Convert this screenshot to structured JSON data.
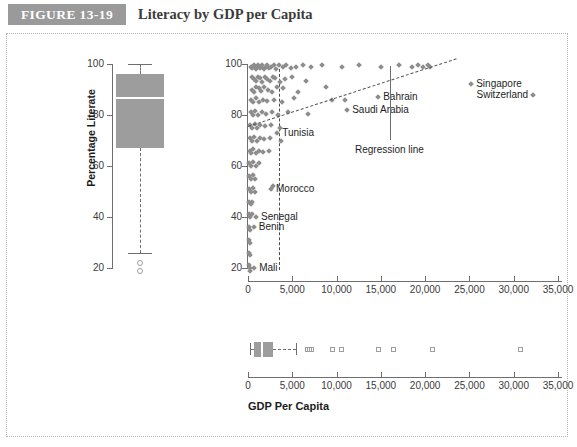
{
  "header": {
    "badge": "FIGURE 13-19",
    "title": "Literacy by GDP per Capita"
  },
  "chart_data": {
    "type": "scatter",
    "title": "Literacy by GDP per Capita",
    "xlabel": "GDP Per Capita",
    "ylabel": "Percentage Literate",
    "xlim": [
      0,
      36500
    ],
    "ylim": [
      15,
      102
    ],
    "xticks": [
      0,
      5000,
      10000,
      15000,
      20000,
      25000,
      30000,
      35000
    ],
    "xticklabels": [
      "0",
      "5,000",
      "10,000",
      "15,000",
      "20,000",
      "25,000",
      "30,000",
      "35,000"
    ],
    "yticks": [
      20,
      40,
      60,
      80,
      100
    ],
    "yticklabels": [
      "20",
      "40",
      "60",
      "80",
      "100"
    ],
    "grid": false,
    "legend": "none",
    "marker": "diamond",
    "marker_color": "#8d8d8d",
    "points": [
      {
        "x": 300,
        "y": 99
      },
      {
        "x": 420,
        "y": 98.5
      },
      {
        "x": 560,
        "y": 99
      },
      {
        "x": 700,
        "y": 99.5
      },
      {
        "x": 850,
        "y": 98
      },
      {
        "x": 980,
        "y": 99
      },
      {
        "x": 1150,
        "y": 99.5
      },
      {
        "x": 1300,
        "y": 98.5
      },
      {
        "x": 1450,
        "y": 99
      },
      {
        "x": 1620,
        "y": 99.5
      },
      {
        "x": 1800,
        "y": 98
      },
      {
        "x": 2000,
        "y": 99
      },
      {
        "x": 2200,
        "y": 99.5
      },
      {
        "x": 2400,
        "y": 98.5
      },
      {
        "x": 2650,
        "y": 99
      },
      {
        "x": 2900,
        "y": 99.5
      },
      {
        "x": 3200,
        "y": 98
      },
      {
        "x": 3500,
        "y": 99.5
      },
      {
        "x": 3900,
        "y": 99
      },
      {
        "x": 4300,
        "y": 99.5
      },
      {
        "x": 4800,
        "y": 98.5
      },
      {
        "x": 5400,
        "y": 99
      },
      {
        "x": 6200,
        "y": 99.5
      },
      {
        "x": 7100,
        "y": 99
      },
      {
        "x": 8300,
        "y": 99.5
      },
      {
        "x": 10600,
        "y": 99
      },
      {
        "x": 12500,
        "y": 99.5
      },
      {
        "x": 15000,
        "y": 99
      },
      {
        "x": 17000,
        "y": 99.5
      },
      {
        "x": 18500,
        "y": 99
      },
      {
        "x": 19200,
        "y": 99.5
      },
      {
        "x": 19800,
        "y": 99
      },
      {
        "x": 20300,
        "y": 99.5
      },
      {
        "x": 20600,
        "y": 99
      },
      {
        "x": 500,
        "y": 95
      },
      {
        "x": 700,
        "y": 94
      },
      {
        "x": 900,
        "y": 93.5
      },
      {
        "x": 1100,
        "y": 95
      },
      {
        "x": 1350,
        "y": 94.5
      },
      {
        "x": 1600,
        "y": 93
      },
      {
        "x": 1900,
        "y": 95
      },
      {
        "x": 2150,
        "y": 94
      },
      {
        "x": 2500,
        "y": 93.5
      },
      {
        "x": 2800,
        "y": 95
      },
      {
        "x": 3100,
        "y": 94.5
      },
      {
        "x": 3600,
        "y": 93
      },
      {
        "x": 4200,
        "y": 94
      },
      {
        "x": 5000,
        "y": 95
      },
      {
        "x": 6500,
        "y": 93.5
      },
      {
        "x": 400,
        "y": 90
      },
      {
        "x": 650,
        "y": 89
      },
      {
        "x": 900,
        "y": 91
      },
      {
        "x": 1200,
        "y": 90.5
      },
      {
        "x": 1500,
        "y": 89.5
      },
      {
        "x": 1850,
        "y": 91
      },
      {
        "x": 2300,
        "y": 90
      },
      {
        "x": 2700,
        "y": 89
      },
      {
        "x": 3300,
        "y": 91
      },
      {
        "x": 4000,
        "y": 90.5
      },
      {
        "x": 5600,
        "y": 89
      },
      {
        "x": 8800,
        "y": 91
      },
      {
        "x": 350,
        "y": 86
      },
      {
        "x": 600,
        "y": 85
      },
      {
        "x": 880,
        "y": 86.5
      },
      {
        "x": 1250,
        "y": 85
      },
      {
        "x": 1700,
        "y": 86
      },
      {
        "x": 2200,
        "y": 85.5
      },
      {
        "x": 2900,
        "y": 86
      },
      {
        "x": 3800,
        "y": 85
      },
      {
        "x": 5200,
        "y": 86.5
      },
      {
        "x": 9500,
        "y": 86
      },
      {
        "x": 11000,
        "y": 86
      },
      {
        "x": 300,
        "y": 81
      },
      {
        "x": 550,
        "y": 80
      },
      {
        "x": 800,
        "y": 81.5
      },
      {
        "x": 1150,
        "y": 80
      },
      {
        "x": 1550,
        "y": 81
      },
      {
        "x": 2050,
        "y": 80.5
      },
      {
        "x": 2750,
        "y": 81
      },
      {
        "x": 3400,
        "y": 80
      },
      {
        "x": 4500,
        "y": 81
      },
      {
        "x": 6800,
        "y": 80.5
      },
      {
        "x": 250,
        "y": 76
      },
      {
        "x": 480,
        "y": 75
      },
      {
        "x": 750,
        "y": 76.5
      },
      {
        "x": 1050,
        "y": 75
      },
      {
        "x": 1400,
        "y": 76
      },
      {
        "x": 1950,
        "y": 75.5
      },
      {
        "x": 2600,
        "y": 76
      },
      {
        "x": 3600,
        "y": 75
      },
      {
        "x": 200,
        "y": 71
      },
      {
        "x": 420,
        "y": 70
      },
      {
        "x": 680,
        "y": 71.5
      },
      {
        "x": 980,
        "y": 70
      },
      {
        "x": 1320,
        "y": 71
      },
      {
        "x": 1800,
        "y": 70.5
      },
      {
        "x": 2450,
        "y": 71
      },
      {
        "x": 3700,
        "y": 70
      },
      {
        "x": 180,
        "y": 66
      },
      {
        "x": 390,
        "y": 65
      },
      {
        "x": 620,
        "y": 66.5
      },
      {
        "x": 920,
        "y": 65
      },
      {
        "x": 1250,
        "y": 66
      },
      {
        "x": 1700,
        "y": 65.5
      },
      {
        "x": 2350,
        "y": 66
      },
      {
        "x": 160,
        "y": 61
      },
      {
        "x": 350,
        "y": 60
      },
      {
        "x": 580,
        "y": 61.5
      },
      {
        "x": 860,
        "y": 60
      },
      {
        "x": 1200,
        "y": 61
      },
      {
        "x": 150,
        "y": 56
      },
      {
        "x": 330,
        "y": 55
      },
      {
        "x": 540,
        "y": 56.5
      },
      {
        "x": 820,
        "y": 55
      },
      {
        "x": 2800,
        "y": 52
      },
      {
        "x": 140,
        "y": 51
      },
      {
        "x": 310,
        "y": 50
      },
      {
        "x": 520,
        "y": 51.5
      },
      {
        "x": 780,
        "y": 50
      },
      {
        "x": 130,
        "y": 46
      },
      {
        "x": 290,
        "y": 45
      },
      {
        "x": 500,
        "y": 46
      },
      {
        "x": 120,
        "y": 41
      },
      {
        "x": 270,
        "y": 40
      },
      {
        "x": 460,
        "y": 41
      },
      {
        "x": 110,
        "y": 36
      },
      {
        "x": 250,
        "y": 35
      },
      {
        "x": 100,
        "y": 31
      },
      {
        "x": 230,
        "y": 30
      },
      {
        "x": 95,
        "y": 26
      },
      {
        "x": 210,
        "y": 25
      },
      {
        "x": 90,
        "y": 21
      },
      {
        "x": 200,
        "y": 20
      },
      {
        "x": 260,
        "y": 19
      }
    ],
    "labeled_points": [
      {
        "name": "Singapore",
        "x": 25200,
        "y": 92,
        "label_side": "right"
      },
      {
        "name": "Switzerland",
        "x": 32200,
        "y": 88,
        "label_side": "left"
      },
      {
        "name": "Bahrain",
        "x": 14700,
        "y": 87,
        "label_side": "right"
      },
      {
        "name": "Saudi Arabia",
        "x": 11200,
        "y": 82,
        "label_side": "right"
      },
      {
        "name": "Tunisia",
        "x": 3300,
        "y": 73,
        "label_side": "right"
      },
      {
        "name": "Morocco",
        "x": 2600,
        "y": 51,
        "label_side": "right"
      },
      {
        "name": "Senegal",
        "x": 900,
        "y": 40,
        "label_side": "right"
      },
      {
        "name": "Benin",
        "x": 650,
        "y": 36,
        "label_side": "right"
      },
      {
        "name": "Mali",
        "x": 700,
        "y": 20,
        "label_side": "right"
      }
    ],
    "regression_line": {
      "label": "Regression line",
      "x0": 0,
      "y0": 75.5,
      "x1": 23500,
      "y1": 102,
      "style": "dashed"
    },
    "reference_line": {
      "orientation": "vertical",
      "x": 3500,
      "style": "dashed"
    },
    "boxplot_y": {
      "label": "Percentage Literate",
      "orientation": "vertical",
      "min_whisker": 26,
      "q1": 67,
      "median": 87,
      "q3": 96,
      "max_whisker": 100,
      "outliers": [
        22,
        19
      ]
    },
    "boxplot_x": {
      "label": "GDP Per Capita",
      "orientation": "horizontal",
      "min_whisker": 180,
      "q1": 700,
      "median": 1500,
      "q3": 2800,
      "max_whisker": 5400,
      "outliers": [
        6700,
        6950,
        7200,
        9500,
        10600,
        14700,
        16400,
        20800,
        30800
      ]
    }
  }
}
